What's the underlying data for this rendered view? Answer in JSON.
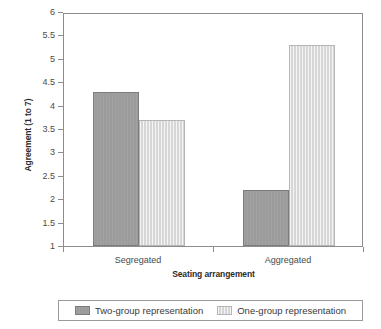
{
  "chart_data": {
    "type": "bar",
    "title": "",
    "subtitle": "",
    "xlabel": "Seating arrangement",
    "ylabel": "Agreement (1 to 7)",
    "categories": [
      "Segregated",
      "Aggregated"
    ],
    "series": [
      {
        "name": "Two-group representation",
        "values": [
          4.3,
          2.2
        ],
        "color": "#9b9b9b"
      },
      {
        "name": "One-group representation",
        "values": [
          3.7,
          5.3
        ],
        "color": "#d6d6d6"
      }
    ],
    "ylim": [
      1,
      6
    ],
    "ytick_step": 0.5,
    "ytick_labels": [
      "6",
      "5.5",
      "5",
      "4.5",
      "4",
      "3.5",
      "3",
      "2.5",
      "2",
      "1.5",
      "1"
    ],
    "grid": false,
    "legend_position": "bottom",
    "annotations": []
  },
  "axes": {
    "y_title": "Agreement (1 to 7)",
    "x_title": "Seating arrangement"
  },
  "legend": {
    "entries": [
      {
        "label": "Two-group representation",
        "swatch": "series-dark"
      },
      {
        "label": "One-group representation",
        "swatch": "series-light"
      }
    ]
  }
}
